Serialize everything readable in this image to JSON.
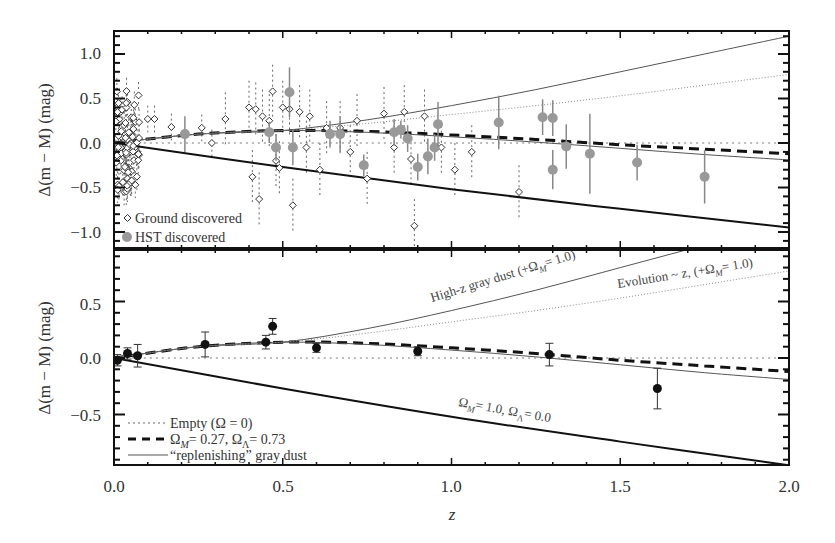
{
  "chart_data": [
    {
      "type": "scatter",
      "panel": "top",
      "title": "",
      "xlabel": "z",
      "ylabel": "Δ(m − M) (mag)",
      "xlim": [
        0.0,
        2.0
      ],
      "ylim": [
        -1.2,
        1.2
      ],
      "x_ticks": [
        "0.0",
        "0.5",
        "1.0",
        "1.5",
        "2.0"
      ],
      "y_ticks": [
        "1.0",
        "0.5",
        "0.0",
        "−0.5",
        "−1.0"
      ],
      "grid": false,
      "legend_position": "lower-left",
      "legend": [
        "Ground discovered",
        "HST discovered"
      ],
      "series": [
        {
          "name": "HST discovered",
          "marker": "filled-circle",
          "color": "#999999",
          "points": [
            {
              "z": 0.21,
              "y": 0.1,
              "err": 0.2
            },
            {
              "z": 0.46,
              "y": 0.12,
              "err": 0.12
            },
            {
              "z": 0.48,
              "y": -0.05,
              "err": 0.15
            },
            {
              "z": 0.52,
              "y": 0.57,
              "err": 0.28
            },
            {
              "z": 0.53,
              "y": -0.05,
              "err": 0.2
            },
            {
              "z": 0.64,
              "y": 0.1,
              "err": 0.15
            },
            {
              "z": 0.67,
              "y": 0.1,
              "err": 0.2
            },
            {
              "z": 0.74,
              "y": -0.25,
              "err": 0.12
            },
            {
              "z": 0.83,
              "y": 0.12,
              "err": 0.15
            },
            {
              "z": 0.85,
              "y": 0.15,
              "err": 0.1
            },
            {
              "z": 0.87,
              "y": 0.05,
              "err": 0.15
            },
            {
              "z": 0.9,
              "y": -0.27,
              "err": 0.15
            },
            {
              "z": 0.93,
              "y": -0.15,
              "err": 0.2
            },
            {
              "z": 0.95,
              "y": -0.05,
              "err": 0.15
            },
            {
              "z": 0.96,
              "y": 0.21,
              "err": 0.25
            },
            {
              "z": 1.14,
              "y": 0.23,
              "err": 0.3
            },
            {
              "z": 1.27,
              "y": 0.29,
              "err": 0.2
            },
            {
              "z": 1.3,
              "y": 0.28,
              "err": 0.2
            },
            {
              "z": 1.3,
              "y": -0.3,
              "err": 0.22
            },
            {
              "z": 1.34,
              "y": -0.04,
              "err": 0.25
            },
            {
              "z": 1.41,
              "y": -0.12,
              "err": 0.45
            },
            {
              "z": 1.55,
              "y": -0.22,
              "err": 0.2
            },
            {
              "z": 1.75,
              "y": -0.38,
              "err": 0.3
            }
          ]
        },
        {
          "name": "Ground discovered",
          "marker": "open-diamond",
          "color": "#333333",
          "points": [
            {
              "z": 0.02,
              "y": 0.35
            },
            {
              "z": 0.03,
              "y": 0.2
            },
            {
              "z": 0.02,
              "y": -0.2
            },
            {
              "z": 0.04,
              "y": -0.4
            },
            {
              "z": 0.05,
              "y": 0.1
            },
            {
              "z": 0.03,
              "y": -0.55
            },
            {
              "z": 0.06,
              "y": 0.25
            },
            {
              "z": 0.07,
              "y": -0.1
            },
            {
              "z": 0.05,
              "y": 0.0
            },
            {
              "z": 0.1,
              "y": 0.27
            },
            {
              "z": 0.12,
              "y": 0.27
            },
            {
              "z": 0.17,
              "y": 0.18
            },
            {
              "z": 0.26,
              "y": 0.17
            },
            {
              "z": 0.29,
              "y": 0.0
            },
            {
              "z": 0.33,
              "y": 0.27
            },
            {
              "z": 0.4,
              "y": 0.4
            },
            {
              "z": 0.41,
              "y": -0.38
            },
            {
              "z": 0.42,
              "y": 0.38
            },
            {
              "z": 0.43,
              "y": -0.63
            },
            {
              "z": 0.44,
              "y": 0.3
            },
            {
              "z": 0.46,
              "y": 0.25
            },
            {
              "z": 0.47,
              "y": 0.58
            },
            {
              "z": 0.48,
              "y": -0.2
            },
            {
              "z": 0.49,
              "y": -0.28
            },
            {
              "z": 0.5,
              "y": 0.4
            },
            {
              "z": 0.52,
              "y": 0.38
            },
            {
              "z": 0.53,
              "y": -0.7
            },
            {
              "z": 0.55,
              "y": 0.35
            },
            {
              "z": 0.57,
              "y": -0.05
            },
            {
              "z": 0.58,
              "y": 0.3
            },
            {
              "z": 0.61,
              "y": -0.3
            },
            {
              "z": 0.63,
              "y": 0.17
            },
            {
              "z": 0.67,
              "y": 0.17
            },
            {
              "z": 0.7,
              "y": -0.1
            },
            {
              "z": 0.72,
              "y": 0.25
            },
            {
              "z": 0.75,
              "y": -0.4
            },
            {
              "z": 0.8,
              "y": 0.33
            },
            {
              "z": 0.83,
              "y": -0.05
            },
            {
              "z": 0.86,
              "y": 0.35
            },
            {
              "z": 0.88,
              "y": -0.18
            },
            {
              "z": 0.89,
              "y": -0.93
            },
            {
              "z": 0.92,
              "y": 0.3
            },
            {
              "z": 0.97,
              "y": -0.05
            },
            {
              "z": 1.01,
              "y": -0.3
            },
            {
              "z": 1.06,
              "y": -0.1
            },
            {
              "z": 1.2,
              "y": -0.55
            }
          ]
        }
      ],
      "curves": [
        {
          "name": "Empty (Ω = 0)",
          "style": "dotted",
          "x": [
            0,
            2.0
          ],
          "y": [
            0,
            0
          ]
        },
        {
          "name": "ΩM = 0.27, ΩΛ = 0.73",
          "style": "thick-dashed",
          "x": [
            0,
            0.25,
            0.5,
            0.75,
            1.0,
            1.25,
            1.5,
            1.75,
            2.0
          ],
          "y": [
            0,
            0.1,
            0.14,
            0.13,
            0.09,
            0.04,
            -0.02,
            -0.07,
            -0.12
          ]
        },
        {
          "name": "“replenishing” gray dust",
          "style": "thin-solid",
          "x": [
            0,
            0.25,
            0.5,
            0.75,
            1.0,
            1.25,
            1.5,
            1.75,
            2.0
          ],
          "y": [
            0,
            0.1,
            0.14,
            0.12,
            0.07,
            0.01,
            -0.06,
            -0.13,
            -0.19
          ]
        },
        {
          "name": "ΩM = 1.0, ΩΛ = 0.0",
          "style": "thick-solid",
          "x": [
            0,
            0.5,
            1.0,
            1.5,
            2.0
          ],
          "y": [
            0,
            -0.27,
            -0.52,
            -0.74,
            -0.95
          ]
        },
        {
          "name": "High-z gray dust (+ΩM = 1.0)",
          "style": "thin-solid",
          "x": [
            0,
            0.25,
            0.5,
            0.75,
            1.0,
            1.25,
            1.5,
            1.75,
            2.0
          ],
          "y": [
            0,
            0.1,
            0.14,
            0.26,
            0.42,
            0.6,
            0.8,
            1.0,
            1.2
          ]
        },
        {
          "name": "Evolution ~ z, (+ΩM = 1.0)",
          "style": "thin-dotted",
          "x": [
            0,
            0.25,
            0.5,
            0.75,
            1.0,
            1.25,
            1.5,
            1.75,
            2.0
          ],
          "y": [
            0,
            0.1,
            0.14,
            0.22,
            0.32,
            0.42,
            0.53,
            0.65,
            0.77
          ]
        }
      ]
    },
    {
      "type": "scatter",
      "panel": "bottom",
      "title": "",
      "xlabel": "z",
      "ylabel": "Δ(m − M) (mag)",
      "xlim": [
        0.0,
        2.0
      ],
      "ylim": [
        -0.95,
        0.95
      ],
      "x_ticks": [
        "0.0",
        "0.5",
        "1.0",
        "1.5",
        "2.0"
      ],
      "y_ticks": [
        "0.5",
        "0.0",
        "−0.5"
      ],
      "grid": false,
      "legend_position": "lower-left",
      "legend": [
        "Empty (Ω = 0)",
        "ΩM = 0.27, ΩΛ = 0.73",
        "“replenishing” gray dust"
      ],
      "series": [
        {
          "name": "Binned data",
          "marker": "filled-circle",
          "color": "#111111",
          "points": [
            {
              "z": 0.01,
              "y": -0.02,
              "err": 0.05
            },
            {
              "z": 0.04,
              "y": 0.04,
              "err": 0.05
            },
            {
              "z": 0.07,
              "y": 0.02,
              "err": 0.1
            },
            {
              "z": 0.27,
              "y": 0.12,
              "err": 0.11
            },
            {
              "z": 0.45,
              "y": 0.14,
              "err": 0.06
            },
            {
              "z": 0.47,
              "y": 0.28,
              "err": 0.07
            },
            {
              "z": 0.6,
              "y": 0.09,
              "err": 0.04
            },
            {
              "z": 0.9,
              "y": 0.06,
              "err": 0.04
            },
            {
              "z": 1.29,
              "y": 0.03,
              "err": 0.1
            },
            {
              "z": 1.61,
              "y": -0.27,
              "err": 0.18
            }
          ]
        }
      ],
      "annotations": [
        {
          "text": "High-z gray dust (+ΩM = 1.0)",
          "z": 0.95,
          "y": 0.57
        },
        {
          "text": "Evolution ~ z, (+ΩM = 1.0)",
          "z": 1.5,
          "y": 0.72
        },
        {
          "text": "ΩM = 1.0, ΩΛ = 0.0",
          "z": 0.95,
          "y": -0.55
        }
      ]
    }
  ],
  "labels": {
    "xlabel": "z",
    "ylabel_top": "Δ(m − M) (mag)",
    "ylabel_bottom": "Δ(m − M) (mag)",
    "x_ticks": [
      "0.0",
      "0.5",
      "1.0",
      "1.5",
      "2.0"
    ],
    "top_y_ticks": [
      "1.0",
      "0.5",
      "0.0",
      "−0.5",
      "−1.0"
    ],
    "bottom_y_ticks": [
      "0.5",
      "0.0",
      "−0.5"
    ],
    "legend_top": [
      "Ground discovered",
      "HST discovered"
    ],
    "legend_bottom_empty": "Empty (Ω = 0)",
    "legend_bottom_lcdm": "= 0.27, Ω",
    "legend_bottom_lcdm_end": "= 0.73",
    "legend_bottom_dust": "“replenishing” gray dust",
    "annot_highz": "High-z gray dust (+Ω",
    "annot_highz_end": "= 1.0)",
    "annot_evol": "Evolution ~ z, (+Ω",
    "annot_evol_end": "= 1.0)",
    "annot_om1": "= 1.0, Ω",
    "annot_om1_end": "= 0.0",
    "sub_m": "M",
    "sub_l": "Λ",
    "omega": "Ω"
  }
}
